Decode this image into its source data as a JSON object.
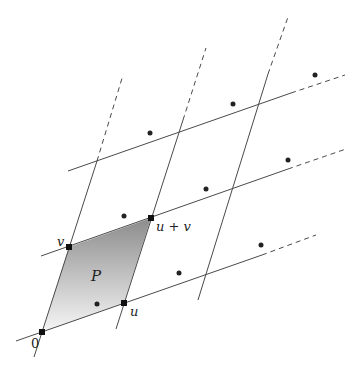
{
  "diagram": {
    "origin": [
      42,
      332
    ],
    "u": [
      82,
      -29
    ],
    "v": [
      27,
      -85
    ],
    "colors": {
      "line": "#555555",
      "point": "#222222",
      "fill_top": "#8f8f8f",
      "fill_bottom": "#f4f4f4"
    },
    "labels": {
      "origin": "0",
      "u": "u",
      "v": "v",
      "u_plus_v": "u + v",
      "parallelogram": "P"
    },
    "vertices": [
      {
        "name": "0",
        "x": 42,
        "y": 332
      },
      {
        "name": "u",
        "x": 124,
        "y": 303
      },
      {
        "name": "v",
        "x": 69,
        "y": 247
      },
      {
        "name": "u+v",
        "x": 151,
        "y": 218
      }
    ],
    "u_lines": [
      {
        "id": "u-line-0",
        "solid": [
          [
            16,
            341
          ],
          [
            130,
            301
          ]
        ],
        "dashed": null
      },
      {
        "id": "u-line-1",
        "solid": [
          [
            41,
            256
          ],
          [
            258,
            180
          ]
        ],
        "dashed": [
          [
            258,
            180
          ],
          [
            290,
            168
          ]
        ]
      },
      {
        "id": "u-line-2",
        "solid": [
          [
            96,
            227
          ],
          [
            290,
            158
          ]
        ],
        "dashed": [
          [
            290,
            158
          ],
          [
            340,
            140
          ]
        ]
      },
      {
        "id": "u-line-3",
        "solid": [
          [
            124,
            303
          ],
          [
            230,
            264
          ]
        ],
        "dashed": null
      },
      {
        "id": "u-line-4",
        "solid": [
          [
            160,
            190
          ],
          [
            290,
            144
          ]
        ],
        "dashed": null
      }
    ],
    "points": [
      {
        "x": 97,
        "y": 304
      },
      {
        "x": 179,
        "y": 275
      },
      {
        "x": 261,
        "y": 246
      },
      {
        "x": 124,
        "y": 218
      },
      {
        "x": 206,
        "y": 189
      },
      {
        "x": 288,
        "y": 160
      },
      {
        "x": 151,
        "y": 133
      },
      {
        "x": 233,
        "y": 104
      },
      {
        "x": 315,
        "y": 75
      }
    ]
  }
}
